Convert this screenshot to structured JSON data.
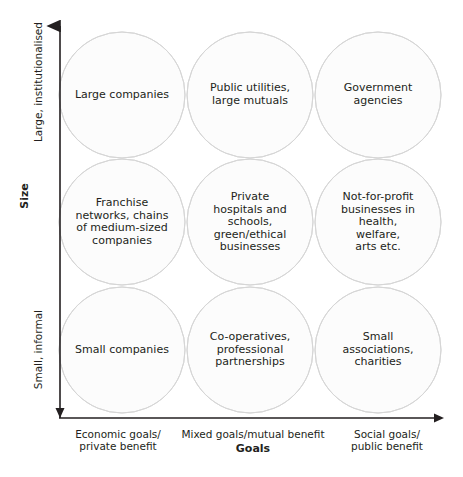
{
  "diagram": {
    "title_hidden": "",
    "axes": {
      "x": {
        "title": "Goals",
        "left_label": "Economic goals/\nprivate benefit",
        "mid_label": "Mixed goals/mutual benefit",
        "right_label": "Social goals/\npublic benefit"
      },
      "y": {
        "title": "Size",
        "top_label": "Large, institutionalised",
        "bottom_label": "Small, informal"
      }
    },
    "colors": {
      "circle_fill": "#fcfcfc",
      "circle_stroke": "#d6d6d6",
      "overlap_fill": "#ececec",
      "axis_line": "#231f20",
      "text": "#231f20",
      "background": "#ffffff"
    },
    "cells": [
      {
        "id": "large-economic",
        "label": "Large companies",
        "row": "large-institutionalised",
        "column": "economic-private"
      },
      {
        "id": "large-mixed",
        "label": "Public utilities,\nlarge mutuals",
        "row": "large-institutionalised",
        "column": "mixed-mutual"
      },
      {
        "id": "large-social",
        "label": "Government\nagencies",
        "row": "large-institutionalised",
        "column": "social-public"
      },
      {
        "id": "medium-economic",
        "label": "Franchise\nnetworks, chains\nof medium-sized\ncompanies",
        "row": "medium",
        "column": "economic-private"
      },
      {
        "id": "medium-mixed",
        "label": "Private\nhospitals and\nschools,\ngreen/ethical\nbusinesses",
        "row": "medium",
        "column": "mixed-mutual"
      },
      {
        "id": "medium-social",
        "label": "Not-for-profit\nbusinesses in\nhealth, welfare,\narts etc.",
        "row": "medium",
        "column": "social-public"
      },
      {
        "id": "small-economic",
        "label": "Small companies",
        "row": "small-informal",
        "column": "economic-private"
      },
      {
        "id": "small-mixed",
        "label": "Co-operatives,\nprofessional\npartnerships",
        "row": "small-informal",
        "column": "mixed-mutual"
      },
      {
        "id": "small-social",
        "label": "Small associations,\ncharities",
        "row": "small-informal",
        "column": "social-public"
      }
    ],
    "geometry": {
      "circle_radius": 63,
      "centers_x": [
        122,
        250,
        378
      ],
      "centers_y": [
        95,
        222,
        350
      ]
    }
  }
}
